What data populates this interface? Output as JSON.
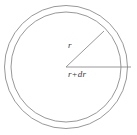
{
  "figure": {
    "type": "geometry-diagram",
    "background_color": "#ffffff",
    "stroke_color": "#8c8c8c",
    "label_color": "#3a3a3a",
    "canvas": {
      "width": 137,
      "height": 135
    },
    "center": {
      "x": 66,
      "y": 67
    },
    "circles": [
      {
        "name": "inner-circle",
        "radius": 55,
        "label": "r",
        "stroke": "#8c8c8c",
        "stroke_width": 0.9
      },
      {
        "name": "outer-circle",
        "radius": 61.5,
        "label": "r+dr",
        "stroke": "#8c8c8c",
        "stroke_width": 0.9
      }
    ],
    "lines": [
      {
        "name": "inner-radius-line",
        "from": {
          "x": 66,
          "y": 67
        },
        "to": {
          "x": 104,
          "y": 31
        },
        "label": "r",
        "angle_deg": 43
      },
      {
        "name": "outer-radius-line",
        "from": {
          "x": 66,
          "y": 67
        },
        "to": {
          "x": 131,
          "y": 67
        },
        "label": "r+dr",
        "angle_deg": 0
      }
    ],
    "labels": {
      "inner_radius": "r",
      "outer_radius": "r+dr"
    }
  }
}
